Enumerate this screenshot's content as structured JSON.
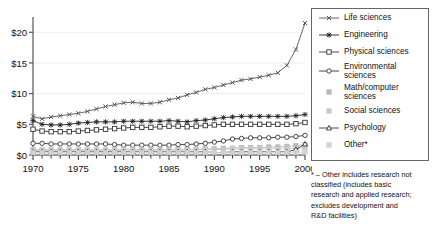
{
  "chart_data": {
    "type": "line",
    "title": "",
    "xlabel": "",
    "ylabel": "",
    "x": [
      1970,
      1971,
      1972,
      1973,
      1974,
      1975,
      1976,
      1977,
      1978,
      1979,
      1980,
      1981,
      1982,
      1983,
      1984,
      1985,
      1986,
      1987,
      1988,
      1989,
      1990,
      1991,
      1992,
      1993,
      1994,
      1995,
      1996,
      1997,
      1998,
      1999,
      2000
    ],
    "xlim": [
      1970,
      2000
    ],
    "ylim": [
      0,
      22
    ],
    "xticks": [
      1970,
      1975,
      1980,
      1985,
      1990,
      1995,
      2000
    ],
    "xtick_labels": [
      "1970",
      "1975",
      "1980",
      "1985",
      "1990",
      "1995",
      "2000"
    ],
    "yticks": [
      0,
      5,
      10,
      15,
      20
    ],
    "ytick_labels": [
      "$0",
      "$5",
      "$10",
      "$15",
      "$20"
    ],
    "grid": "horizontal-faint",
    "legend_position": "right-outside",
    "units": "billions of dollars",
    "series": [
      {
        "name": "Life sciences",
        "marker": "x-cross",
        "color": "#555555",
        "values": [
          6.3,
          5.9,
          6.2,
          6.4,
          6.6,
          6.8,
          7.1,
          7.5,
          7.9,
          8.2,
          8.5,
          8.6,
          8.4,
          8.4,
          8.6,
          9.0,
          9.3,
          9.8,
          10.2,
          10.7,
          11.0,
          11.4,
          11.8,
          12.2,
          12.4,
          12.7,
          13.0,
          13.4,
          14.6,
          17.2,
          21.5
        ]
      },
      {
        "name": "Engineering",
        "marker": "asterisk",
        "color": "#222222",
        "values": [
          5.6,
          5.0,
          4.9,
          4.9,
          5.0,
          5.2,
          5.3,
          5.4,
          5.4,
          5.4,
          5.5,
          5.5,
          5.5,
          5.5,
          5.5,
          5.6,
          5.5,
          5.4,
          5.6,
          5.7,
          5.9,
          6.1,
          6.2,
          6.3,
          6.3,
          6.3,
          6.3,
          6.3,
          6.3,
          6.4,
          6.6
        ]
      },
      {
        "name": "Physical sciences",
        "marker": "square-open",
        "color": "#333333",
        "values": [
          4.2,
          3.9,
          3.8,
          3.8,
          3.8,
          3.9,
          4.0,
          4.1,
          4.2,
          4.3,
          4.4,
          4.5,
          4.5,
          4.5,
          4.6,
          4.7,
          4.7,
          4.6,
          4.7,
          4.8,
          4.9,
          5.0,
          5.0,
          5.0,
          5.0,
          5.0,
          5.0,
          5.0,
          5.0,
          5.1,
          5.3
        ]
      },
      {
        "name": "Environmental\nsciences",
        "marker": "circle-open",
        "color": "#333333",
        "values": [
          1.9,
          1.9,
          1.8,
          1.8,
          1.8,
          1.8,
          1.8,
          1.8,
          1.8,
          1.7,
          1.6,
          1.6,
          1.6,
          1.6,
          1.6,
          1.6,
          1.7,
          1.7,
          1.8,
          1.9,
          2.1,
          2.3,
          2.6,
          2.7,
          2.8,
          2.8,
          2.8,
          2.9,
          2.9,
          3.0,
          3.2
        ]
      },
      {
        "name": "Math/computer\nsciences",
        "marker": "square-gray",
        "color": "#b9b9b9",
        "values": [
          0.7,
          0.7,
          0.7,
          0.7,
          0.7,
          0.7,
          0.7,
          0.7,
          0.7,
          0.7,
          0.8,
          0.8,
          0.8,
          0.8,
          0.8,
          0.9,
          0.9,
          0.9,
          0.9,
          1.0,
          1.0,
          1.1,
          1.1,
          1.2,
          1.2,
          1.2,
          1.3,
          1.3,
          1.4,
          1.5,
          1.7
        ]
      },
      {
        "name": "Social sciences",
        "marker": "square-gray",
        "color": "#c9c9c9",
        "values": [
          0.9,
          0.9,
          0.9,
          0.9,
          0.9,
          0.9,
          0.9,
          0.9,
          0.9,
          0.9,
          0.9,
          0.9,
          0.8,
          0.8,
          0.8,
          0.8,
          0.8,
          0.8,
          0.9,
          0.9,
          0.9,
          0.9,
          1.0,
          1.0,
          1.0,
          1.0,
          1.0,
          1.0,
          1.0,
          1.1,
          1.2
        ]
      },
      {
        "name": "Psychology",
        "marker": "triangle-open",
        "color": "#333333",
        "values": [
          0.5,
          0.5,
          0.5,
          0.5,
          0.5,
          0.5,
          0.5,
          0.5,
          0.5,
          0.5,
          0.5,
          0.5,
          0.5,
          0.5,
          0.5,
          0.5,
          0.5,
          0.5,
          0.5,
          0.5,
          0.4,
          0.4,
          0.5,
          0.5,
          0.5,
          0.5,
          0.5,
          0.5,
          0.5,
          0.9,
          1.8
        ]
      },
      {
        "name": "Other*",
        "marker": "square-gray",
        "color": "#d2d2d2",
        "values": [
          0.4,
          0.4,
          0.4,
          0.4,
          0.4,
          0.4,
          0.4,
          0.4,
          0.4,
          0.4,
          0.4,
          0.4,
          0.4,
          0.4,
          0.4,
          0.4,
          0.4,
          0.4,
          0.4,
          0.4,
          0.4,
          0.4,
          0.4,
          0.4,
          0.4,
          0.4,
          0.4,
          0.4,
          0.4,
          0.4,
          0.5
        ]
      }
    ]
  },
  "legend": {
    "items": [
      {
        "label": "Life sciences",
        "marker": "x-cross"
      },
      {
        "label": "Engineering",
        "marker": "asterisk"
      },
      {
        "label": "Physical sciences",
        "marker": "square-open"
      },
      {
        "label": "Environmental\nsciences",
        "marker": "circle-open"
      },
      {
        "label": "Math/computer\nsciences",
        "marker": "square-gray"
      },
      {
        "label": "Social sciences",
        "marker": "square-gray"
      },
      {
        "label": "Psychology",
        "marker": "triangle-open"
      },
      {
        "label": "Other*",
        "marker": "square-gray"
      }
    ]
  },
  "footnote": {
    "lines": [
      "* – Other includes research not",
      "classified (includes basic",
      "research and applied research;",
      "excludes development and",
      "R&D facilities)"
    ]
  }
}
